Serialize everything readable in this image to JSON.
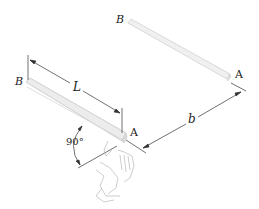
{
  "diagram": {
    "type": "physics-figure",
    "rod_near": {
      "end_left": "B",
      "end_right": "A",
      "length_label": "L"
    },
    "rod_far": {
      "end_left": "B",
      "end_right": "A"
    },
    "separation_label": "b",
    "angle_label": "90°",
    "colors": {
      "rod_fill": "#ececec",
      "rod_edge": "#c8c8c8",
      "line": "#333333",
      "text": "#222222"
    }
  }
}
